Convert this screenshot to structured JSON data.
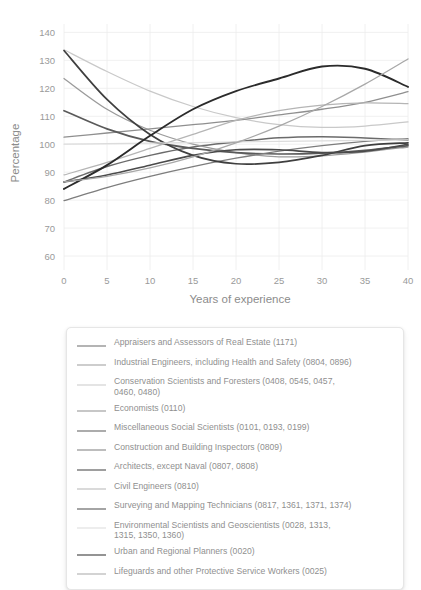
{
  "chart_data": {
    "type": "line",
    "title": "",
    "xlabel": "Years of experience",
    "ylabel": "Percentage",
    "xlim": [
      0,
      40
    ],
    "ylim": [
      55,
      143
    ],
    "xticks": [
      0,
      5,
      10,
      15,
      20,
      25,
      30,
      35,
      40
    ],
    "yticks": [
      60,
      70,
      80,
      90,
      100,
      110,
      120,
      130,
      140
    ],
    "grid": true,
    "legend_position": "below",
    "x": [
      0,
      5,
      10,
      15,
      20,
      25,
      30,
      35,
      40
    ],
    "series": [
      {
        "name": "Appraisers and Assessors of Real Estate (1171)",
        "color": "#6b6b6b",
        "width": 1.5,
        "values": [
          86.5,
          92.0,
          96.0,
          99.0,
          100.8,
          102.3,
          102.7,
          102.2,
          101.5
        ]
      },
      {
        "name": "Industrial Engineers, including Health and Safety (0804, 0896)",
        "color": "#9b9b9b",
        "width": 1.3,
        "values": [
          123.5,
          112.5,
          105.0,
          100.0,
          97.0,
          95.5,
          95.8,
          97.2,
          99.0
        ]
      },
      {
        "name": "Conservation Scientists and Foresters (0408, 0545, 0457, 0460, 0480)",
        "color": "#c9c9c9",
        "width": 1.2,
        "values": [
          133.8,
          126.0,
          119.0,
          113.5,
          109.5,
          107.0,
          106.0,
          106.5,
          108.0
        ]
      },
      {
        "name": "Economists (0110)",
        "color": "#8f8f8f",
        "width": 1.3,
        "values": [
          102.5,
          104.0,
          105.5,
          107.0,
          108.5,
          110.5,
          112.5,
          115.0,
          118.8
        ]
      },
      {
        "name": "Miscellaneous Social Scientists (0101, 0193, 0199)",
        "color": "#5a5a5a",
        "width": 1.7,
        "values": [
          112.0,
          105.5,
          101.0,
          98.5,
          97.0,
          96.5,
          96.8,
          97.8,
          99.5
        ]
      },
      {
        "name": "Construction and Building Inspectors (0809)",
        "color": "#7d7d7d",
        "width": 1.3,
        "values": [
          79.8,
          84.5,
          88.5,
          92.0,
          95.0,
          97.5,
          99.5,
          101.0,
          102.0
        ]
      },
      {
        "name": "Architects, except Naval (0807, 0808)",
        "color": "#3f3f3f",
        "width": 1.7,
        "values": [
          133.5,
          116.0,
          103.5,
          96.0,
          93.0,
          93.5,
          96.0,
          99.5,
          100.5
        ]
      },
      {
        "name": "Civil Engineers (0810)",
        "color": "#b5b5b5",
        "width": 1.2,
        "values": [
          89.0,
          93.5,
          98.5,
          103.5,
          108.5,
          112.0,
          114.0,
          114.8,
          114.5
        ]
      },
      {
        "name": "Surveying and Mapping Technicians (0817, 1361, 1371, 1374)",
        "color": "#4a4a4a",
        "width": 1.6,
        "values": [
          86.5,
          89.0,
          92.5,
          96.0,
          98.0,
          98.0,
          97.0,
          97.5,
          100.0
        ]
      },
      {
        "name": "Environmental Scientists and Geoscientists (0028, 1313, 1315, 1350, 1360)",
        "color": "#dcdcdc",
        "width": 1.2,
        "values": [
          100.0,
          100.2,
          100.4,
          100.6,
          100.8,
          101.0,
          101.2,
          101.4,
          101.6
        ]
      },
      {
        "name": "Urban and Regional Planners (0020)",
        "color": "#2b2b2b",
        "width": 1.9,
        "values": [
          84.0,
          92.5,
          103.0,
          112.5,
          119.0,
          123.5,
          127.8,
          127.0,
          120.5
        ]
      },
      {
        "name": "Lifeguards and other Protective Service Workers (0025)",
        "color": "#a8a8a8",
        "width": 1.3,
        "values": [
          86.5,
          88.5,
          91.5,
          95.5,
          100.5,
          106.5,
          113.5,
          121.5,
          130.5
        ]
      }
    ]
  },
  "legend": {
    "items": [
      {
        "label": "Appraisers and Assessors of Real Estate (1171)"
      },
      {
        "label": "Industrial Engineers, including Health and Safety (0804, 0896)"
      },
      {
        "label": "Conservation Scientists and Foresters (0408, 0545, 0457,\n0460, 0480)"
      },
      {
        "label": "Economists (0110)"
      },
      {
        "label": "Miscellaneous Social Scientists (0101, 0193, 0199)"
      },
      {
        "label": "Construction and Building Inspectors (0809)"
      },
      {
        "label": "Architects, except Naval (0807, 0808)"
      },
      {
        "label": "Civil Engineers (0810)"
      },
      {
        "label": "Surveying and Mapping Technicians (0817, 1361, 1371, 1374)"
      },
      {
        "label": "Environmental Scientists and Geoscientists (0028, 1313,\n1315, 1350, 1360)"
      },
      {
        "label": "Urban and Regional Planners (0020)"
      },
      {
        "label": "Lifeguards and other Protective Service Workers (0025)"
      }
    ]
  }
}
